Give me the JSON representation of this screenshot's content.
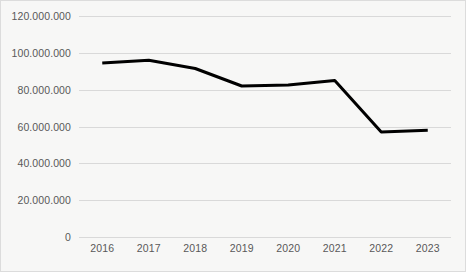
{
  "chart_data": {
    "type": "line",
    "title": "",
    "xlabel": "",
    "ylabel": "",
    "categories": [
      "2016",
      "2017",
      "2018",
      "2019",
      "2020",
      "2021",
      "2022",
      "2023"
    ],
    "values": [
      94500000,
      96000000,
      91500000,
      82000000,
      82500000,
      85000000,
      57000000,
      58000000
    ],
    "series": [
      {
        "name": "",
        "values": [
          94500000,
          96000000,
          91500000,
          82000000,
          82500000,
          85000000,
          57000000,
          58000000
        ]
      }
    ],
    "ylim": [
      0,
      120000000
    ],
    "ytick_values": [
      0,
      20000000,
      40000000,
      60000000,
      80000000,
      100000000,
      120000000
    ],
    "ytick_labels": [
      "0",
      "20.000.000",
      "40.000.000",
      "60.000.000",
      "80.000.000",
      "100.000.000",
      "120.000.000"
    ],
    "xtick_labels": [
      "2016",
      "2017",
      "2018",
      "2019",
      "2020",
      "2021",
      "2022",
      "2023"
    ],
    "grid": true,
    "grid_axis": "y",
    "legend": false,
    "legend_position": "none",
    "line_color": "#000000",
    "line_width": 3,
    "markers": false,
    "plot_background": "#f7f7f6",
    "grid_color": "#d9d9d9",
    "tick_label_color": "#595959",
    "border_color": "#dcdcdc",
    "annotations": []
  }
}
